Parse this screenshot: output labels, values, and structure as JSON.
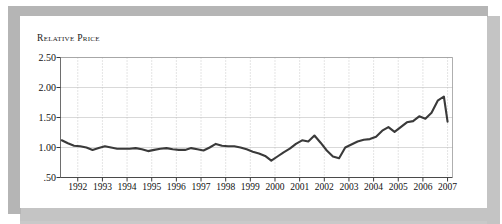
{
  "figure": {
    "title": "Relative Price",
    "frame_color": "#b5b5b5",
    "panel_color": "#ffffff",
    "line_color": "#3a3a3a"
  },
  "chart_data": {
    "type": "line",
    "title": "Relative Price",
    "xlabel": "",
    "ylabel": "Relative Price",
    "ylim": [
      0.5,
      2.5
    ],
    "xlim": [
      1991.3,
      2007.2
    ],
    "grid": true,
    "legend": false,
    "ytick_labels": [
      "2.50",
      "2.00",
      "1.50",
      "1.00",
      ".50"
    ],
    "ytick_values": [
      2.5,
      2.0,
      1.5,
      1.0,
      0.5
    ],
    "xtick_labels": [
      "1992",
      "1993",
      "1994",
      "1995",
      "1996",
      "1997",
      "1998",
      "1999",
      "2000",
      "2001",
      "2002",
      "2003",
      "2004",
      "2005",
      "2006",
      "2007"
    ],
    "xtick_values": [
      1992,
      1993,
      1994,
      1995,
      1996,
      1997,
      1998,
      1999,
      2000,
      2001,
      2002,
      2003,
      2004,
      2005,
      2006,
      2007
    ],
    "series": [
      {
        "name": "Relative Price",
        "color": "#3a3a3a",
        "x": [
          1991.35,
          1991.6,
          1991.85,
          1992.1,
          1992.35,
          1992.6,
          1992.85,
          1993.1,
          1993.35,
          1993.6,
          1993.85,
          1994.1,
          1994.35,
          1994.6,
          1994.85,
          1995.1,
          1995.35,
          1995.6,
          1995.85,
          1996.1,
          1996.35,
          1996.6,
          1996.85,
          1997.1,
          1997.35,
          1997.6,
          1997.85,
          1998.1,
          1998.35,
          1998.6,
          1998.85,
          1999.1,
          1999.35,
          1999.6,
          1999.85,
          2000.1,
          2000.35,
          2000.6,
          2000.85,
          2001.1,
          2001.35,
          2001.6,
          2001.85,
          2002.1,
          2002.35,
          2002.6,
          2002.85,
          2003.1,
          2003.35,
          2003.6,
          2003.85,
          2004.1,
          2004.35,
          2004.6,
          2004.85,
          2005.1,
          2005.35,
          2005.6,
          2005.85,
          2006.1,
          2006.35,
          2006.6,
          2006.85,
          2007.0
        ],
        "y": [
          1.12,
          1.07,
          1.03,
          1.02,
          1.0,
          0.96,
          0.99,
          1.02,
          1.0,
          0.98,
          0.98,
          0.98,
          0.99,
          0.97,
          0.94,
          0.96,
          0.98,
          0.99,
          0.97,
          0.96,
          0.96,
          0.99,
          0.97,
          0.95,
          1.0,
          1.06,
          1.03,
          1.02,
          1.02,
          1.0,
          0.97,
          0.93,
          0.9,
          0.86,
          0.78,
          0.85,
          0.92,
          0.98,
          1.06,
          1.12,
          1.1,
          1.2,
          1.08,
          0.95,
          0.85,
          0.82,
          1.0,
          1.05,
          1.1,
          1.13,
          1.14,
          1.18,
          1.28,
          1.34,
          1.26,
          1.34,
          1.42,
          1.44,
          1.52,
          1.48,
          1.58,
          1.78,
          1.85,
          1.43
        ]
      }
    ]
  }
}
